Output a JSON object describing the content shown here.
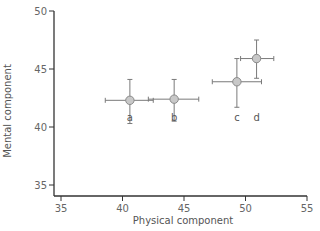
{
  "chart_data": {
    "type": "scatter",
    "title": "",
    "xlabel": "Physical component",
    "ylabel": "Mental component",
    "xlim": [
      34.5,
      55
    ],
    "ylim": [
      34,
      50
    ],
    "x_ticks": [
      35,
      40,
      45,
      50,
      55
    ],
    "y_ticks": [
      35,
      40,
      45,
      50
    ],
    "grid": false,
    "legend": null,
    "error_bars": true,
    "points": [
      {
        "label": "a",
        "x": 40.6,
        "y": 42.3,
        "x_err": [
          38.6,
          42.5
        ],
        "y_err": [
          40.3,
          44.1
        ]
      },
      {
        "label": "b",
        "x": 44.2,
        "y": 42.4,
        "x_err": [
          42.1,
          46.2
        ],
        "y_err": [
          40.5,
          44.1
        ]
      },
      {
        "label": "c",
        "x": 49.3,
        "y": 43.9,
        "x_err": [
          47.3,
          51.3
        ],
        "y_err": [
          41.7,
          45.9
        ]
      },
      {
        "label": "d",
        "x": 50.9,
        "y": 45.9,
        "x_err": [
          49.6,
          52.3
        ],
        "y_err": [
          44.2,
          47.5
        ]
      }
    ],
    "point_labels_y": 40.8
  },
  "style": {
    "axis_color": "#333333",
    "errorbar_color": "#7a7a7a",
    "marker_fill": "#c8c8c8",
    "marker_stroke": "#8a8a8a"
  }
}
